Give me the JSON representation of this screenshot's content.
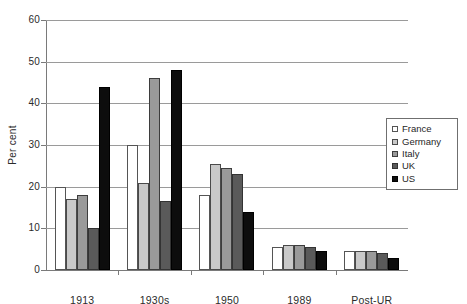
{
  "chart_data": {
    "type": "bar",
    "title": "",
    "subtitle": "",
    "xlabel": "",
    "ylabel": "Per cent",
    "categories": [
      "1913",
      "1930s",
      "1950",
      "1989",
      "Post-UR"
    ],
    "ylim": [
      0,
      60
    ],
    "ytick_labels": [
      "0",
      "10",
      "20",
      "30",
      "40",
      "50",
      "60"
    ],
    "ytick_values": [
      0,
      10,
      20,
      30,
      40,
      50,
      60
    ],
    "grid": true,
    "legend_position": "right",
    "series": [
      {
        "name": "France",
        "color": "#ffffff",
        "values": [
          20,
          30,
          18,
          5.5,
          4.5
        ]
      },
      {
        "name": "Germany",
        "color": "#c9c9c9",
        "values": [
          17,
          21,
          25.5,
          6,
          4.5
        ]
      },
      {
        "name": "Italy",
        "color": "#9a9a9a",
        "values": [
          18,
          46,
          24.5,
          6,
          4.5
        ]
      },
      {
        "name": "UK",
        "color": "#5a5a5a",
        "values": [
          10,
          16.5,
          23,
          5.5,
          4
        ]
      },
      {
        "name": "US",
        "color": "#0d0d0d",
        "values": [
          44,
          48,
          14,
          4.5,
          3
        ]
      }
    ]
  },
  "legend": {
    "items": [
      {
        "label": "France"
      },
      {
        "label": "Germany"
      },
      {
        "label": "Italy"
      },
      {
        "label": "UK"
      },
      {
        "label": "US"
      }
    ]
  }
}
